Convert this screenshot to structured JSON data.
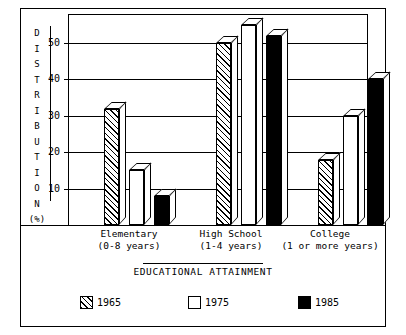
{
  "chart_data": {
    "type": "bar",
    "title": "",
    "xlabel": "EDUCATIONAL ATTAINMENT",
    "ylabel": "DISTRIBUTION (%)",
    "ylabel_letters": [
      "D",
      "I",
      "S",
      "T",
      "R",
      "I",
      "B",
      "U",
      "T",
      "I",
      "O",
      "N",
      "(%)"
    ],
    "categories": [
      "Elementary",
      "High School",
      "College"
    ],
    "category_sublabels": [
      "(0-8 years)",
      "(1-4 years)",
      "(1 or more years)"
    ],
    "series": [
      {
        "name": "1965",
        "fill": "hatch",
        "values": [
          32,
          50,
          18
        ]
      },
      {
        "name": "1975",
        "fill": "white",
        "values": [
          15,
          55,
          30
        ]
      },
      {
        "name": "1985",
        "fill": "black",
        "values": [
          8,
          52,
          40
        ]
      }
    ],
    "yticks": [
      10,
      20,
      30,
      40,
      50
    ],
    "ytick_labels": [
      "10",
      "20",
      "30",
      "40",
      "50"
    ],
    "ylim": [
      0,
      58
    ],
    "grid": true,
    "legend_position": "bottom",
    "style": "3d-isometric-line-art",
    "colors": {
      "ink": "#000000",
      "paper": "#ffffff"
    }
  },
  "legend": {
    "items": [
      {
        "label": "1965",
        "fill": "hatch"
      },
      {
        "label": "1975",
        "fill": "white"
      },
      {
        "label": "1985",
        "fill": "black"
      }
    ]
  }
}
